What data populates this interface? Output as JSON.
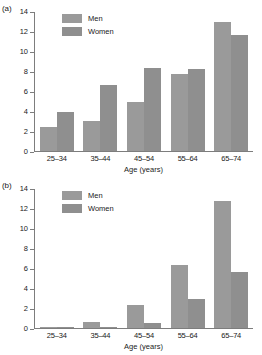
{
  "chart_data": [
    {
      "type": "bar",
      "panel": "(a)",
      "title": "",
      "xlabel": "Age (years)",
      "ylabel": "",
      "ylim": [
        0,
        14
      ],
      "yticks": [
        0,
        2,
        4,
        6,
        8,
        10,
        12,
        14
      ],
      "grid": false,
      "legend_position": "top-left",
      "categories": [
        "25–34",
        "35–44",
        "45–54",
        "55–64",
        "65–74"
      ],
      "series": [
        {
          "name": "Men",
          "color": "#9a9a9a",
          "values": [
            2.4,
            3.0,
            4.9,
            7.8,
            13.0
          ]
        },
        {
          "name": "Women",
          "color": "#8f8f8f",
          "values": [
            3.9,
            6.6,
            8.4,
            8.3,
            11.7
          ]
        }
      ]
    },
    {
      "type": "bar",
      "panel": "(b)",
      "title": "",
      "xlabel": "Age (years)",
      "ylabel": "",
      "ylim": [
        0,
        14
      ],
      "yticks": [
        0,
        2,
        4,
        6,
        8,
        10,
        12,
        14
      ],
      "grid": false,
      "legend_position": "top-left",
      "categories": [
        "25–34",
        "35–44",
        "45–54",
        "55–64",
        "65–74"
      ],
      "series": [
        {
          "name": "Men",
          "color": "#9a9a9a",
          "values": [
            0.1,
            0.6,
            2.3,
            6.3,
            12.8
          ]
        },
        {
          "name": "Women",
          "color": "#8f8f8f",
          "values": [
            0.1,
            0.15,
            0.55,
            2.9,
            5.6
          ]
        }
      ]
    }
  ],
  "panel_a": {
    "label": "(a)",
    "legend": {
      "men": "Men",
      "women": "Women"
    },
    "yticks": [
      "14",
      "12",
      "10",
      "8",
      "6",
      "4",
      "2",
      "0"
    ],
    "xlabels": [
      "25–34",
      "35–44",
      "45–54",
      "55–64",
      "65–74"
    ],
    "xtitle": "Age (years)"
  },
  "panel_b": {
    "label": "(b)",
    "legend": {
      "men": "Men",
      "women": "Women"
    },
    "yticks": [
      "14",
      "12",
      "10",
      "8",
      "6",
      "4",
      "2",
      "0"
    ],
    "xlabels": [
      "25–34",
      "35–44",
      "45–54",
      "55–64",
      "65–74"
    ],
    "xtitle": "Age (years)"
  }
}
